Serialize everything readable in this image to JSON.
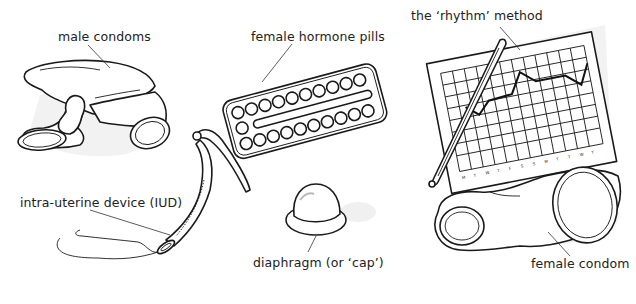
{
  "figure": {
    "items": [
      {
        "id": "male-condoms",
        "label": "male condoms"
      },
      {
        "id": "female-hormone-pills",
        "label": "female hormone pills"
      },
      {
        "id": "rhythm-method",
        "label": "the ‘rhythm’ method"
      },
      {
        "id": "iud",
        "label": "intra-uterine device (IUD)"
      },
      {
        "id": "diaphragm",
        "label": "diaphragm (or ‘cap’)"
      },
      {
        "id": "female-condom",
        "label": "female condom"
      }
    ]
  }
}
